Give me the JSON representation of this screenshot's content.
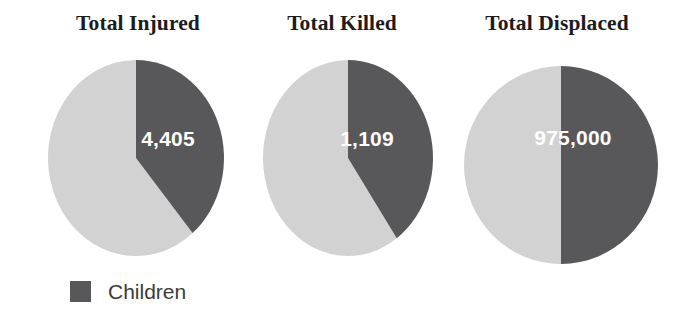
{
  "chart_data": {
    "type": "pie",
    "title": "",
    "subtitle": "",
    "legend": {
      "position": "bottom-left",
      "entries": [
        {
          "label": "Children",
          "color": "#58585a"
        }
      ]
    },
    "colors": {
      "children": "#58585a",
      "other": "#d2d2d2",
      "background": "#ffffff",
      "title_text": "#1c1c1c",
      "value_text": "#ffffff",
      "legend_text": "#3b3b3b"
    },
    "charts": [
      {
        "title": "Total Injured",
        "value_label": "4,405",
        "value": 4405,
        "slices": [
          {
            "name": "Children",
            "fraction": 0.389,
            "start_angle": 0,
            "end_angle": 140,
            "color": "#58585a"
          },
          {
            "name": "Other",
            "fraction": 0.611,
            "start_angle": 140,
            "end_angle": 360,
            "color": "#d2d2d2"
          }
        ]
      },
      {
        "title": "Total Killed",
        "value_label": "1,109",
        "value": 1109,
        "slices": [
          {
            "name": "Children",
            "fraction": 0.403,
            "start_angle": 0,
            "end_angle": 145,
            "color": "#58585a"
          },
          {
            "name": "Other",
            "fraction": 0.597,
            "start_angle": 145,
            "end_angle": 360,
            "color": "#d2d2d2"
          }
        ]
      },
      {
        "title": "Total Displaced",
        "value_label": "975,000",
        "value": 975000,
        "slices": [
          {
            "name": "Children",
            "fraction": 0.5,
            "start_angle": 0,
            "end_angle": 180,
            "color": "#58585a"
          },
          {
            "name": "Other",
            "fraction": 0.5,
            "start_angle": 180,
            "end_angle": 360,
            "color": "#d2d2d2"
          }
        ]
      }
    ]
  },
  "titles": {
    "chart0": "Total Injured",
    "chart1": "Total Killed",
    "chart2": "Total Displaced"
  },
  "values": {
    "chart0": "4,405",
    "chart1": "1,109",
    "chart2": "975,000"
  },
  "legend": {
    "children_label": "Children"
  }
}
